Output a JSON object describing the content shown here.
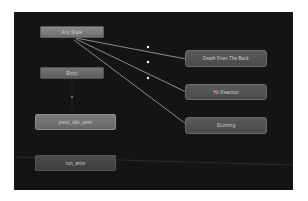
{
  "animator": {
    "canvas_bg": "#141414",
    "nodes": {
      "any_state": "Any State",
      "entry": "Entry",
      "pistol_idle": "pistol_idle_anim",
      "run_anim": "run_anim",
      "death_from_back": "Death From The Back",
      "hit_reaction": "Hit Reaction",
      "stunning": "Stunning"
    },
    "transitions": [
      {
        "from": "Any State",
        "to": "Death From The Back"
      },
      {
        "from": "Any State",
        "to": "Hit Reaction"
      },
      {
        "from": "Any State",
        "to": "Stunning"
      },
      {
        "from": "Entry",
        "to": "pistol_idle_anim"
      }
    ]
  }
}
